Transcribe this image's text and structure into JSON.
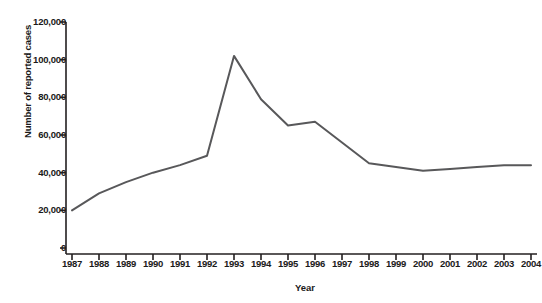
{
  "chart_data": {
    "type": "line",
    "title": "",
    "xlabel": "Year",
    "ylabel": "Number of reported cases",
    "categories": [
      "1987",
      "1988",
      "1989",
      "1990",
      "1991",
      "1992",
      "1993",
      "1994",
      "1995",
      "1996",
      "1997",
      "1998",
      "1999",
      "2000",
      "2001",
      "2002",
      "2003",
      "2004"
    ],
    "x": [
      1987,
      1988,
      1989,
      1990,
      1991,
      1992,
      1993,
      1994,
      1995,
      1996,
      1997,
      1998,
      1999,
      2000,
      2001,
      2002,
      2003,
      2004
    ],
    "values": [
      20000,
      29000,
      35000,
      40000,
      44000,
      49000,
      102000,
      79000,
      65000,
      67000,
      56000,
      45000,
      43000,
      41000,
      42000,
      43000,
      44000,
      44000
    ],
    "series": [
      {
        "name": "Number of reported cases",
        "values": [
          20000,
          29000,
          35000,
          40000,
          44000,
          49000,
          102000,
          79000,
          65000,
          67000,
          56000,
          45000,
          43000,
          41000,
          42000,
          43000,
          44000,
          44000
        ]
      }
    ],
    "ylim": [
      0,
      120000
    ],
    "yticks": [
      0,
      20000,
      40000,
      60000,
      80000,
      100000,
      120000
    ],
    "ytick_labels": [
      "0",
      "20,000",
      "40,000",
      "60,000",
      "80,000",
      "100,000",
      "120,000"
    ],
    "grid": false,
    "legend": false,
    "legend_position": "none",
    "line_color": "#58585a",
    "axis_color": "#231f20"
  },
  "axis_titles": {
    "y": "Number of reported cases",
    "x": "Year"
  }
}
